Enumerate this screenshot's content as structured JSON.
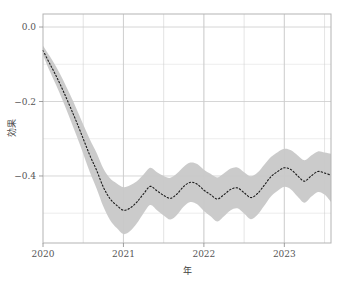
{
  "chart_data": {
    "type": "line",
    "title": "",
    "subtitle": "",
    "xlabel": "年",
    "ylabel": "効果",
    "xlim": [
      2020.0,
      2023.58
    ],
    "ylim": [
      -0.58,
      0.035
    ],
    "xticks": [
      2020,
      2021,
      2022,
      2023
    ],
    "xtick_labels": [
      "2020",
      "2021",
      "2022",
      "2023"
    ],
    "yticks": [
      0.0,
      -0.2,
      -0.4
    ],
    "ytick_labels": [
      "0.0",
      "-0.2",
      "-0.4"
    ],
    "grid": true,
    "grid_minor": true,
    "grid_color": "#cccccc",
    "legend": "none",
    "line_style": "dotted",
    "line_color": "#1a1a1a",
    "band_color": "#c8c8c8",
    "band_label": "信頼区間",
    "series": [
      {
        "name": "効果",
        "x": [
          2020.0,
          2020.083,
          2020.167,
          2020.25,
          2020.333,
          2020.417,
          2020.5,
          2020.583,
          2020.667,
          2020.75,
          2020.833,
          2020.917,
          2021.0,
          2021.083,
          2021.167,
          2021.25,
          2021.333,
          2021.417,
          2021.5,
          2021.583,
          2021.667,
          2021.75,
          2021.833,
          2021.917,
          2022.0,
          2022.083,
          2022.167,
          2022.25,
          2022.333,
          2022.417,
          2022.5,
          2022.583,
          2022.667,
          2022.75,
          2022.833,
          2022.917,
          2023.0,
          2023.083,
          2023.167,
          2023.25,
          2023.333,
          2023.417,
          2023.5,
          2023.58
        ],
        "values": [
          -0.063,
          -0.098,
          -0.133,
          -0.171,
          -0.212,
          -0.255,
          -0.3,
          -0.345,
          -0.385,
          -0.43,
          -0.461,
          -0.479,
          -0.492,
          -0.486,
          -0.47,
          -0.448,
          -0.428,
          -0.44,
          -0.452,
          -0.46,
          -0.448,
          -0.428,
          -0.417,
          -0.422,
          -0.438,
          -0.45,
          -0.462,
          -0.45,
          -0.436,
          -0.432,
          -0.445,
          -0.458,
          -0.447,
          -0.425,
          -0.402,
          -0.388,
          -0.378,
          -0.383,
          -0.4,
          -0.414,
          -0.4,
          -0.388,
          -0.392,
          -0.398
        ],
        "lower": [
          -0.075,
          -0.118,
          -0.158,
          -0.2,
          -0.245,
          -0.292,
          -0.34,
          -0.39,
          -0.434,
          -0.482,
          -0.518,
          -0.54,
          -0.556,
          -0.548,
          -0.527,
          -0.5,
          -0.478,
          -0.492,
          -0.506,
          -0.517,
          -0.504,
          -0.482,
          -0.47,
          -0.476,
          -0.494,
          -0.508,
          -0.522,
          -0.508,
          -0.492,
          -0.487,
          -0.501,
          -0.516,
          -0.504,
          -0.48,
          -0.455,
          -0.44,
          -0.429,
          -0.436,
          -0.456,
          -0.472,
          -0.456,
          -0.443,
          -0.45,
          -0.47
        ],
        "upper": [
          -0.05,
          -0.078,
          -0.108,
          -0.142,
          -0.18,
          -0.22,
          -0.262,
          -0.302,
          -0.338,
          -0.38,
          -0.406,
          -0.42,
          -0.43,
          -0.425,
          -0.414,
          -0.396,
          -0.378,
          -0.39,
          -0.4,
          -0.405,
          -0.393,
          -0.375,
          -0.364,
          -0.368,
          -0.383,
          -0.394,
          -0.404,
          -0.393,
          -0.38,
          -0.377,
          -0.39,
          -0.401,
          -0.391,
          -0.37,
          -0.349,
          -0.336,
          -0.327,
          -0.331,
          -0.345,
          -0.358,
          -0.345,
          -0.334,
          -0.337,
          -0.34
        ]
      }
    ]
  },
  "axes": {
    "y_title": "効果",
    "x_title": "年"
  }
}
